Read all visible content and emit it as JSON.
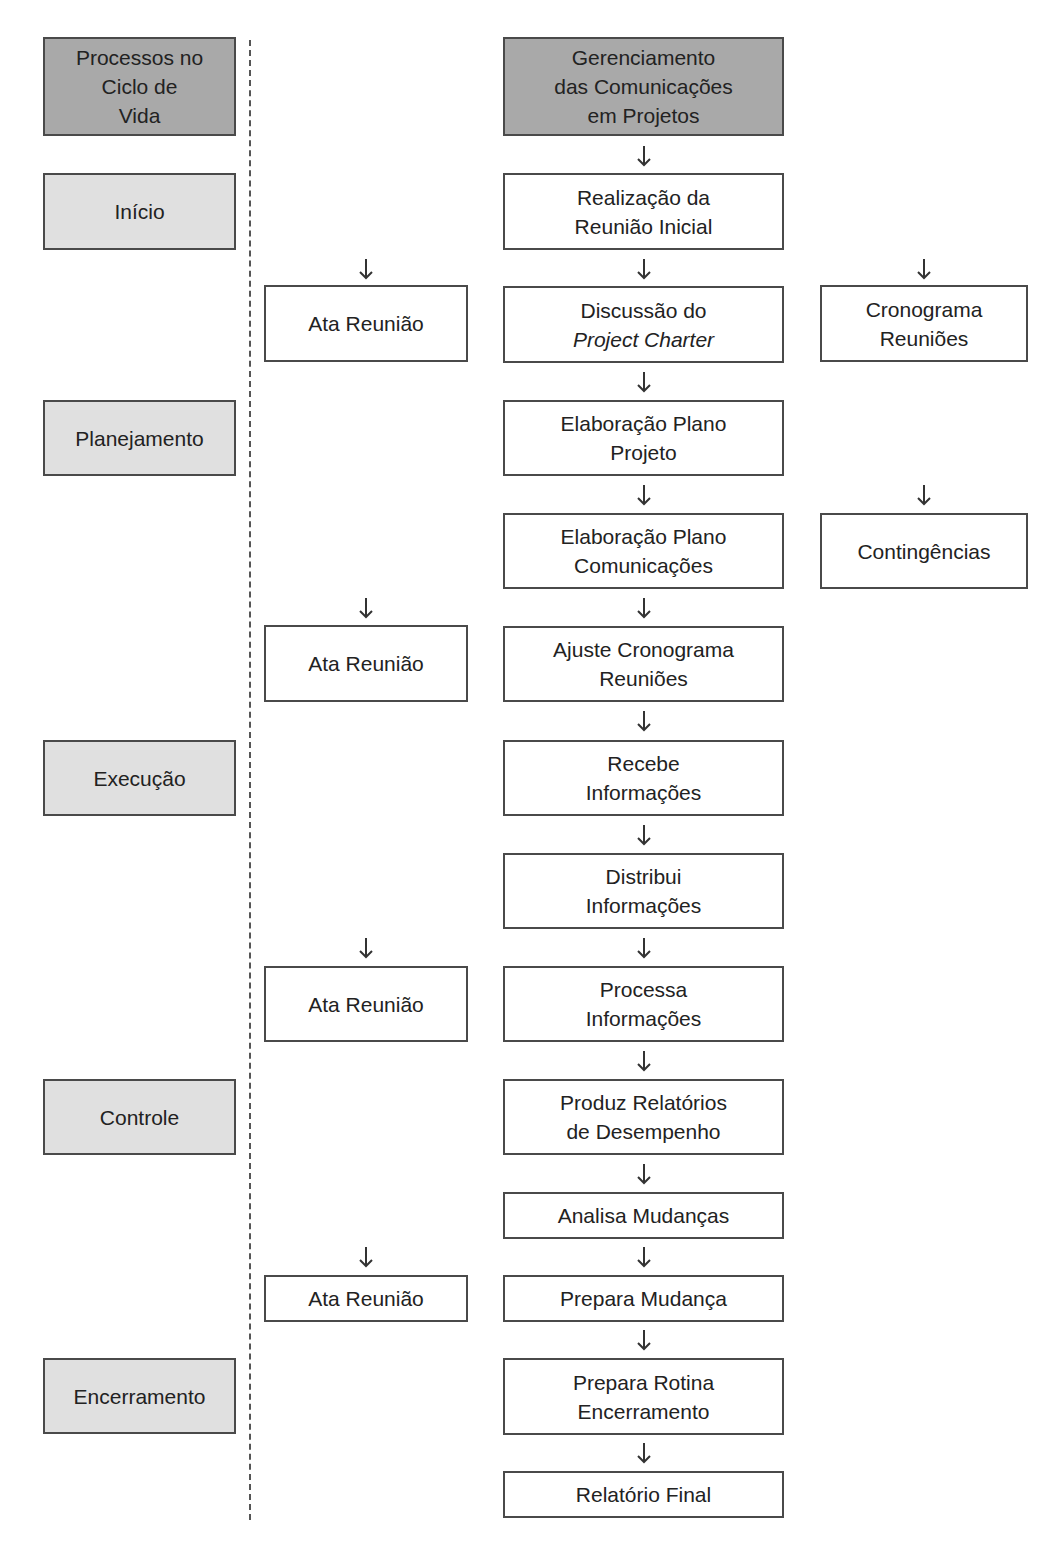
{
  "lifecycle": {
    "header": [
      "Processos no",
      "Ciclo de",
      "Vida"
    ],
    "phases": [
      {
        "label": "Início"
      },
      {
        "label": "Planejamento"
      },
      {
        "label": "Execução"
      },
      {
        "label": "Controle"
      },
      {
        "label": "Encerramento"
      }
    ]
  },
  "main": {
    "header": [
      "Gerenciamento",
      "das Comunicações",
      "em Projetos"
    ],
    "steps": [
      {
        "lines": [
          "Realização da",
          "Reunião Inicial"
        ]
      },
      {
        "lines": [
          "Discussão do",
          "Project Charter"
        ]
      },
      {
        "lines": [
          "Elaboração Plano",
          "Projeto"
        ]
      },
      {
        "lines": [
          "Elaboração Plano",
          "Comunicações"
        ]
      },
      {
        "lines": [
          "Ajuste Cronograma",
          "Reuniões"
        ]
      },
      {
        "lines": [
          "Recebe",
          "Informações"
        ]
      },
      {
        "lines": [
          "Distribui",
          "Informações"
        ]
      },
      {
        "lines": [
          "Processa",
          "Informações"
        ]
      },
      {
        "lines": [
          "Produz Relatórios",
          "de Desempenho"
        ]
      },
      {
        "lines": [
          "Analisa Mudanças"
        ]
      },
      {
        "lines": [
          "Prepara Mudança"
        ]
      },
      {
        "lines": [
          "Prepara Rotina",
          "Encerramento"
        ]
      },
      {
        "lines": [
          "Relatório Final"
        ]
      }
    ]
  },
  "outputs_left": [
    {
      "label": "Ata Reunião"
    },
    {
      "label": "Ata Reunião"
    },
    {
      "label": "Ata Reunião"
    },
    {
      "label": "Ata Reunião"
    }
  ],
  "outputs_right": [
    {
      "lines": [
        "Cronograma",
        "Reuniões"
      ]
    },
    {
      "label": "Contingências"
    }
  ],
  "colors": {
    "header_fill": "#a9a9a9",
    "phase_fill": "#e0e0e0",
    "box_border": "#4a4a4a"
  }
}
